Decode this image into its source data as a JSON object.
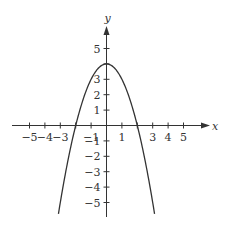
{
  "chart_data": {
    "type": "line",
    "title": "",
    "function": "y = 4 - x^2",
    "xlabel": "x",
    "ylabel": "y",
    "xlim": [
      -6,
      6
    ],
    "ylim": [
      -6,
      6
    ],
    "grid": false,
    "x_tick_labels": [
      "−5",
      "−4",
      "−3",
      "−1",
      "1",
      "3",
      "4",
      "5"
    ],
    "x_tick_values": [
      -5,
      -4,
      -3,
      -1,
      1,
      3,
      4,
      5
    ],
    "y_tick_labels": [
      "5",
      "3",
      "2",
      "1",
      "−1",
      "−2",
      "−3",
      "−4",
      "−5"
    ],
    "y_tick_values": [
      5,
      3,
      2,
      1,
      -1,
      -2,
      -3,
      -4,
      -5
    ],
    "series": [
      {
        "name": "y = 4 - x^2",
        "x": [
          -3.1,
          -3,
          -2.5,
          -2,
          -1.5,
          -1,
          -0.5,
          0,
          0.5,
          1,
          1.5,
          2,
          2.5,
          3,
          3.1
        ],
        "y": [
          -5.61,
          -5,
          -2.25,
          0,
          1.75,
          3,
          3.75,
          4,
          3.75,
          3,
          1.75,
          0,
          -2.25,
          -5,
          -5.61
        ]
      }
    ],
    "color": "#333333"
  }
}
